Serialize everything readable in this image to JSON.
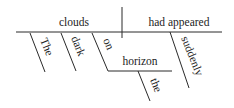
{
  "diagram": {
    "type": "sentence-diagram",
    "subject": "clouds",
    "verb": "had appeared",
    "modifiers": {
      "subject": [
        "The",
        "dark"
      ],
      "verb": [
        "suddenly"
      ]
    },
    "prepositional_phrase": {
      "preposition": "on",
      "object": "horizon",
      "object_modifiers": [
        "the"
      ]
    },
    "colors": {
      "line": "#2a2a2a",
      "text": "#1c1c1c",
      "background": "#ffffff"
    }
  }
}
